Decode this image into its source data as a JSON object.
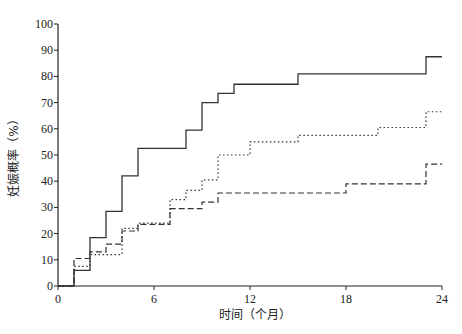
{
  "chart_data": {
    "type": "line",
    "step": true,
    "title": "",
    "xlabel": "时间（个月）",
    "ylabel": "妊娠概率（%）",
    "xlim": [
      0,
      24
    ],
    "ylim": [
      0,
      100
    ],
    "x_ticks": [
      0,
      6,
      12,
      18,
      24
    ],
    "y_ticks": [
      0,
      10,
      20,
      30,
      40,
      50,
      60,
      70,
      80,
      90,
      100
    ],
    "grid": false,
    "legend": null,
    "series": [
      {
        "name": "solid",
        "style": "solid",
        "points": [
          [
            0,
            0
          ],
          [
            1,
            6
          ],
          [
            2,
            18.5
          ],
          [
            3,
            28.5
          ],
          [
            4,
            42
          ],
          [
            5,
            52.5
          ],
          [
            8,
            59.5
          ],
          [
            9,
            70
          ],
          [
            10,
            73.5
          ],
          [
            11,
            77
          ],
          [
            15,
            81
          ],
          [
            23,
            87.5
          ],
          [
            24,
            87.5
          ]
        ]
      },
      {
        "name": "dotted",
        "style": "dotted",
        "points": [
          [
            0,
            0
          ],
          [
            1,
            7.5
          ],
          [
            2,
            12
          ],
          [
            4,
            22
          ],
          [
            5,
            24
          ],
          [
            7,
            33
          ],
          [
            8,
            36.5
          ],
          [
            9,
            40.5
          ],
          [
            10,
            50
          ],
          [
            12,
            55
          ],
          [
            15,
            57.5
          ],
          [
            20,
            60.5
          ],
          [
            23,
            66.5
          ],
          [
            24,
            66.5
          ]
        ]
      },
      {
        "name": "dashed",
        "style": "dashed",
        "points": [
          [
            0,
            0
          ],
          [
            1,
            10.5
          ],
          [
            2,
            13
          ],
          [
            3,
            16
          ],
          [
            4,
            21
          ],
          [
            5,
            23.5
          ],
          [
            7,
            29.5
          ],
          [
            9,
            32
          ],
          [
            10,
            35.5
          ],
          [
            18,
            39
          ],
          [
            23,
            46.5
          ],
          [
            24,
            46.5
          ]
        ]
      }
    ]
  },
  "colors": {
    "line": "#333333",
    "axis": "#222222"
  }
}
